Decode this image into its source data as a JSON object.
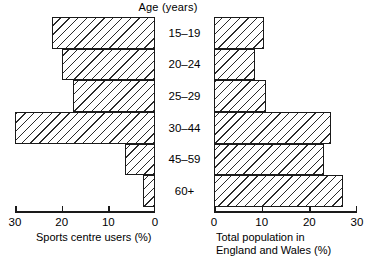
{
  "chart_data": {
    "type": "bar",
    "title": "Age (years)",
    "orientation": "horizontal-pyramid",
    "categories": [
      "15–19",
      "20–24",
      "25–29",
      "30–44",
      "45–59",
      "60+"
    ],
    "series": [
      {
        "name": "Sports centre users (%)",
        "side": "left",
        "axis_title_lines": [
          "Sports centre users (%)"
        ],
        "xlabel": "Sports centre users (%)",
        "ticks": [
          30,
          20,
          10,
          0
        ],
        "tick_labels": [
          "30",
          "20",
          "10",
          "0"
        ],
        "xlim": [
          30,
          0
        ],
        "direction": "right-to-left",
        "values": [
          22,
          20,
          17.5,
          30,
          6.5,
          2.5
        ]
      },
      {
        "name": "Total population in England and Wales (%)",
        "side": "right",
        "axis_title_lines": [
          "Total population in",
          "England and Wales (%)"
        ],
        "xlabel": "Total population in England and Wales (%)",
        "ticks": [
          0,
          10,
          20,
          30
        ],
        "tick_labels": [
          "0",
          "10",
          "20",
          "30"
        ],
        "xlim": [
          0,
          30
        ],
        "direction": "left-to-right",
        "values": [
          10.5,
          8.5,
          11,
          24.5,
          23,
          27
        ]
      }
    ],
    "ylabel": "Age (years)",
    "grid": false,
    "legend": false,
    "bar_style": "diagonal-hatch",
    "colors": {
      "bar_outline": "#1a1a1a",
      "bar_hatch": "#2b2b2b",
      "bar_fill": "#ffffff",
      "axis": "#1a1a1a",
      "text": "#000000",
      "background": "#ffffff"
    }
  }
}
